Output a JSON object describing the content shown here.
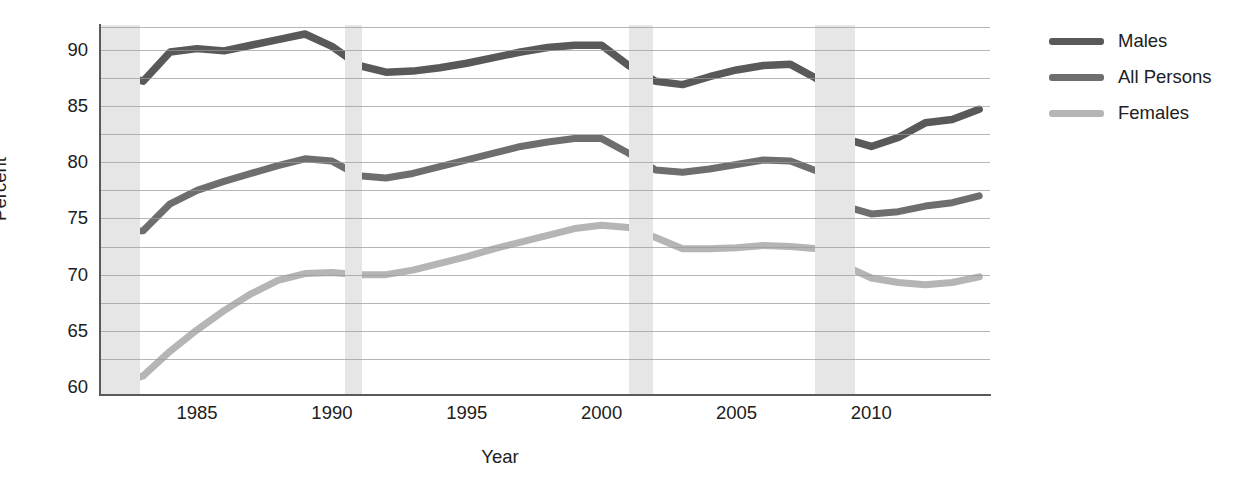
{
  "chart_data": {
    "type": "line",
    "title": "",
    "xlabel": "Year",
    "ylabel": "Percent",
    "xlim": [
      1981.4,
      2014.4
    ],
    "ylim": [
      59.3,
      92.2
    ],
    "xticks": [
      "1985",
      "1990",
      "1995",
      "2000",
      "2005",
      "2010"
    ],
    "xtick_values": [
      1985,
      1990,
      1995,
      2000,
      2005,
      2010
    ],
    "yticks": [
      "60",
      "65",
      "70",
      "75",
      "80",
      "85",
      "90"
    ],
    "ytick_values": [
      60,
      65,
      70,
      75,
      80,
      85,
      90
    ],
    "gridline_values": [
      62.5,
      65,
      67.5,
      70,
      72.5,
      75,
      77.5,
      80,
      82.5,
      85,
      87.5,
      90,
      92
    ],
    "grid": true,
    "legend_position": "right",
    "x": [
      1982,
      1983,
      1984,
      1985,
      1986,
      1987,
      1988,
      1989,
      1990,
      1991,
      1992,
      1993,
      1994,
      1995,
      1996,
      1997,
      1998,
      1999,
      2000,
      2001,
      2002,
      2003,
      2004,
      2005,
      2006,
      2007,
      2008,
      2009,
      2010,
      2011,
      2012,
      2013,
      2014
    ],
    "series": [
      {
        "name": "Males",
        "color": "#595959",
        "values": [
          87.8,
          87.2,
          89.8,
          90.1,
          89.9,
          90.4,
          90.9,
          91.4,
          90.3,
          88.6,
          88.0,
          88.1,
          88.4,
          88.8,
          89.3,
          89.8,
          90.2,
          90.4,
          90.4,
          88.6,
          87.2,
          86.9,
          87.6,
          88.2,
          88.6,
          88.7,
          87.4,
          82.1,
          81.4,
          82.2,
          83.5,
          83.8,
          84.7
        ]
      },
      {
        "name": "All Persons",
        "color": "#6e6e6e",
        "values": [
          73.8,
          73.9,
          76.3,
          77.5,
          78.3,
          79.0,
          79.7,
          80.3,
          80.1,
          78.8,
          78.6,
          79.0,
          79.6,
          80.2,
          80.8,
          81.4,
          81.8,
          82.1,
          82.1,
          80.8,
          79.3,
          79.1,
          79.4,
          79.8,
          80.2,
          80.1,
          79.2,
          76.1,
          75.4,
          75.6,
          76.1,
          76.4,
          77.0
        ]
      },
      {
        "name": "Females",
        "color": "#b5b5b5",
        "values": [
          60.2,
          61.0,
          63.2,
          65.1,
          66.8,
          68.3,
          69.5,
          70.1,
          70.2,
          70.0,
          70.0,
          70.4,
          71.0,
          71.6,
          72.3,
          72.9,
          73.5,
          74.1,
          74.4,
          74.2,
          73.3,
          72.3,
          72.3,
          72.4,
          72.6,
          72.5,
          72.3,
          70.8,
          69.7,
          69.3,
          69.1,
          69.3,
          69.8
        ]
      }
    ],
    "recession_bands": [
      {
        "start": 1981.4,
        "end": 1982.9
      },
      {
        "start": 1990.5,
        "end": 1991.1
      },
      {
        "start": 2001.0,
        "end": 2001.9
      },
      {
        "start": 2007.9,
        "end": 2009.4
      }
    ]
  },
  "legend": {
    "items": [
      {
        "label": "Males"
      },
      {
        "label": "All Persons"
      },
      {
        "label": "Females"
      }
    ]
  }
}
